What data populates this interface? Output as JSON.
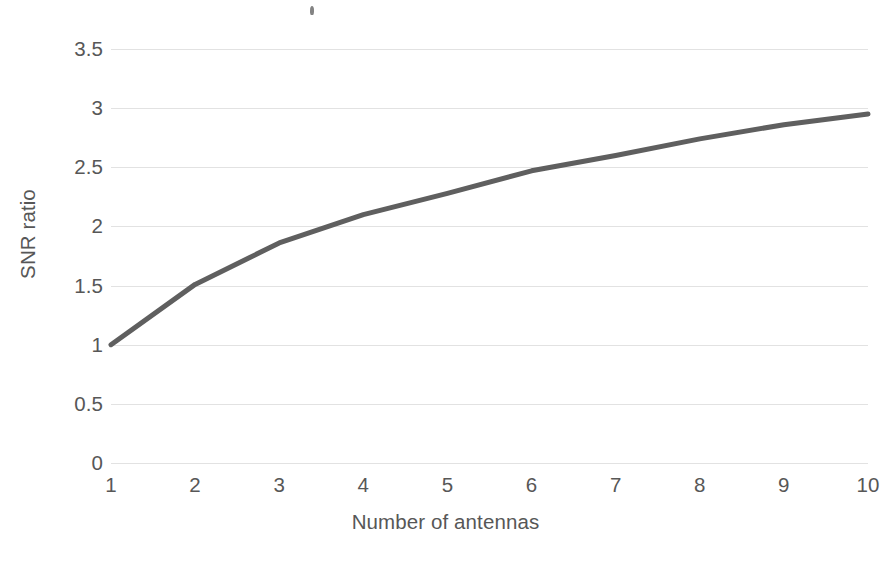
{
  "chart_data": {
    "type": "line",
    "title": "",
    "xlabel": "Number of antennas",
    "ylabel": "SNR ratio",
    "x": [
      1,
      2,
      3,
      4,
      5,
      6,
      7,
      8,
      9,
      10
    ],
    "values": [
      1,
      1.51,
      1.86,
      2.1,
      2.28,
      2.47,
      2.6,
      2.74,
      2.86,
      2.95
    ],
    "series": [
      {
        "name": "SNR ratio",
        "values": [
          1,
          1.51,
          1.86,
          2.1,
          2.28,
          2.47,
          2.6,
          2.74,
          2.86,
          2.95
        ]
      }
    ],
    "xlim": [
      1,
      10
    ],
    "ylim": [
      0,
      3.5
    ],
    "x_tick_labels": [
      "1",
      "2",
      "3",
      "4",
      "5",
      "6",
      "7",
      "8",
      "9",
      "10"
    ],
    "y_tick_labels": [
      "0",
      "0.5",
      "1",
      "1.5",
      "2",
      "2.5",
      "3",
      "3.5"
    ],
    "y_tick_values": [
      0,
      0.5,
      1,
      1.5,
      2,
      2.5,
      3,
      3.5
    ],
    "grid": "horizontal",
    "legend": "none",
    "line_color": "#5f5f5f",
    "grid_color": "#e2e2e2",
    "text_color": "#575757",
    "background_color": "#ffffff",
    "line_width": 5,
    "markers": "none"
  },
  "annotations": {
    "scan_artifact_label": ""
  }
}
